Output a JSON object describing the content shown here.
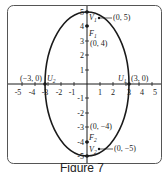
{
  "figure": {
    "caption": "Figure 7",
    "colors": {
      "stroke": "#1a1a1a",
      "frame": "#555555",
      "background": "#ffffff"
    }
  },
  "axes": {
    "x_ticks": [
      "-5",
      "-4",
      "-3",
      "-2",
      "-1",
      "1",
      "2",
      "3",
      "4",
      "5"
    ],
    "y_ticks": [
      "5",
      "4",
      "3",
      "2",
      "1",
      "-1",
      "-2",
      "-3",
      "-4",
      "-5"
    ],
    "xlim": [
      -5,
      5
    ],
    "ylim": [
      -5,
      5
    ]
  },
  "ellipse": {
    "equation_center": [
      0,
      0
    ],
    "semi_major_vertical": 5,
    "semi_minor_horizontal": 3
  },
  "points": [
    {
      "name": "V1",
      "label": "V",
      "sub": "1",
      "coord_label": "(0, 5)",
      "x": 0,
      "y": 5
    },
    {
      "name": "F1",
      "label": "F",
      "sub": "1",
      "coord_label": "(0, 4)",
      "x": 0,
      "y": 4
    },
    {
      "name": "U2",
      "label": "U",
      "sub": "2",
      "coord_label": "(−3, 0)",
      "x": -3,
      "y": 0
    },
    {
      "name": "U1",
      "label": "U",
      "sub": "1",
      "coord_label": "(3, 0)",
      "x": 3,
      "y": 0
    },
    {
      "name": "F2",
      "label": "F",
      "sub": "2",
      "coord_label": "(0, −4)",
      "x": 0,
      "y": -4
    },
    {
      "name": "V2",
      "label": "V",
      "sub": "2",
      "coord_label": "(0, −5)",
      "x": 0,
      "y": -5
    }
  ]
}
